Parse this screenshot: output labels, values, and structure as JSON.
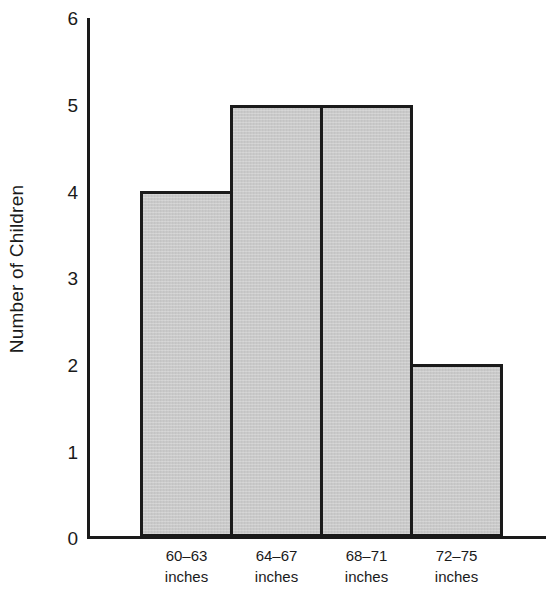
{
  "chart_data": {
    "type": "bar",
    "title": "",
    "subtitle": "",
    "xlabel": "",
    "ylabel": "Number of Children",
    "categories": [
      "60–63 inches",
      "64–67 inches",
      "68–71 inches",
      "72–75 inches"
    ],
    "category_lines": [
      {
        "range": "60–63",
        "unit": "inches"
      },
      {
        "range": "64–67",
        "unit": "inches"
      },
      {
        "range": "68–71",
        "unit": "inches"
      },
      {
        "range": "72–75",
        "unit": "inches"
      }
    ],
    "values": [
      4,
      5,
      5,
      2
    ],
    "ylim": [
      0,
      6
    ],
    "ytick_labels": [
      "0",
      "1",
      "2",
      "3",
      "4",
      "5",
      "6"
    ],
    "ytick_values": [
      0,
      1,
      2,
      3,
      4,
      5,
      6
    ],
    "grid": false,
    "legend": "none",
    "bar_fill_color": "#c9c9c9",
    "bar_edge_color": "#1a1a1a",
    "axis_color": "#1a1a1a",
    "background_color": "#ffffff",
    "bars_contiguous": true
  }
}
